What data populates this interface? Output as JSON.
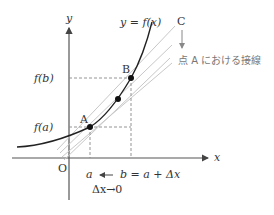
{
  "diagram": {
    "axes": {
      "x_label": "x",
      "y_label": "y",
      "origin_label": "O"
    },
    "curve_label": "y = f(x)",
    "points": {
      "A": "A",
      "B": "B",
      "C": "C"
    },
    "y_ticks": {
      "fa": "f(a)",
      "fb": "f(b)"
    },
    "x_ticks": {
      "a": "a",
      "b": "b = a + Δx"
    },
    "limit_label": "Δx→0",
    "tangent_note": "点 A における接線",
    "colors": {
      "curve": "#222222",
      "axis": "#555555",
      "secant": "#c8c8c8",
      "dashed": "#888888",
      "text": "#333333",
      "note": "#777777"
    }
  }
}
